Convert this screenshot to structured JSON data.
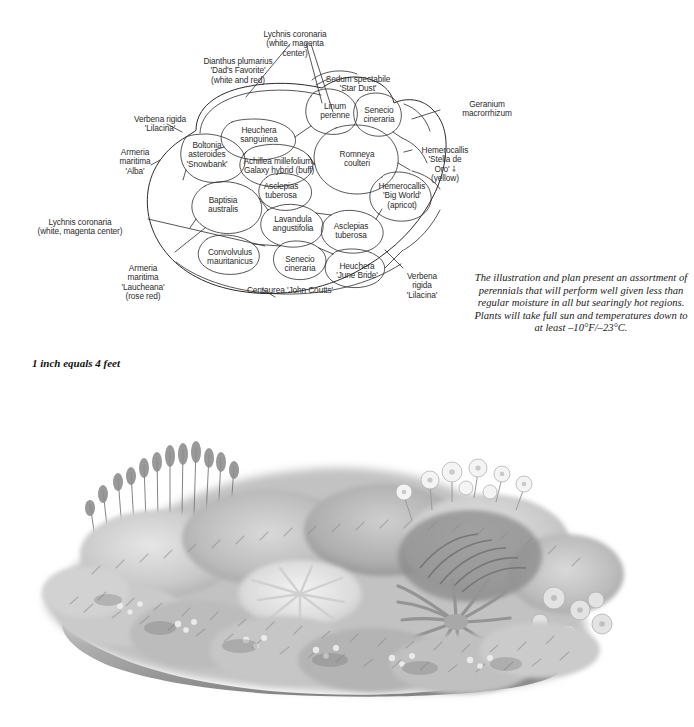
{
  "page": {
    "background_color": "#ffffff",
    "line_color": "#2b2b2b"
  },
  "scale": {
    "note": "1 inch equals 4 feet"
  },
  "caption": {
    "text": "The illustration and plan present an assortment of perennials that will perform well given less than regular moisture in all but searingly hot regions. Plants will take full sun and temperatures down to at least –10°F/–23°C."
  },
  "plan": {
    "callouts": [
      {
        "id": "lychnis-top",
        "name": "Lychnis coronaria\n(white, magenta\ncenter)"
      },
      {
        "id": "dianthus",
        "name": "Dianthus plumarius\n'Dad's Favorite'\n(white and red)"
      },
      {
        "id": "sedum",
        "name": "Sedum spectabile\n'Star Dust'"
      },
      {
        "id": "geranium",
        "name": "Geranium\nmacrorrhizum"
      },
      {
        "id": "verbena-left",
        "name": "Verbena rigida\n'Lilacina'"
      },
      {
        "id": "armeria-alba",
        "name": "Armeria\nmaritima\n'Alba'"
      },
      {
        "id": "hemerocallis-stella",
        "name": "Hemerocallis\n'Stella de\nOro' ⸸\n(yellow)"
      },
      {
        "id": "lychnis-left",
        "name": "Lychnis coronaria\n(white, magenta center)"
      },
      {
        "id": "armeria-laucheana",
        "name": "Armeria\nmaritima\n'Laucheana'\n(rose red)"
      },
      {
        "id": "verbena-right",
        "name": "Verbena\nrigida\n'Lilacina'"
      }
    ],
    "cells": [
      {
        "id": "linum",
        "name": "Linum\nperenne"
      },
      {
        "id": "senecio-top",
        "name": "Senecio\ncineraria"
      },
      {
        "id": "heuchera-sanguinea",
        "name": "Heuchera\nsanguinea"
      },
      {
        "id": "romneya",
        "name": "Romneya\ncoulteri"
      },
      {
        "id": "boltonia",
        "name": "Boltonia\nasteroides\n'Snowbank'"
      },
      {
        "id": "achillea",
        "name": "Achillea millefolium,\nGalaxy hybrid (buff)"
      },
      {
        "id": "baptisia",
        "name": "Baptisia\naustralis"
      },
      {
        "id": "asclepias-1",
        "name": "Asclepias\ntuberosa"
      },
      {
        "id": "lavandula",
        "name": "Lavandula\nangustifolia"
      },
      {
        "id": "asclepias-2",
        "name": "Asclepias\ntuberosa"
      },
      {
        "id": "hemerocallis-big-world",
        "name": "Hemerocallis\n'Big World'\n(apricot)"
      },
      {
        "id": "convolvulus",
        "name": "Convolvulus\nmauritanicus"
      },
      {
        "id": "senecio-bottom",
        "name": "Senecio\ncineraria"
      },
      {
        "id": "heuchera-june-bride",
        "name": "Heuchera\n'June Bride'"
      },
      {
        "id": "centaurea",
        "name": "Centaurea 'John Coutts'"
      }
    ]
  },
  "illustration": {
    "alt": "Grayscale painted illustration of a mounded perennial border with tall flower spikes at rear, mounding foliage and poppy-like blooms at center right, and low spreading mats of foliage in front."
  }
}
